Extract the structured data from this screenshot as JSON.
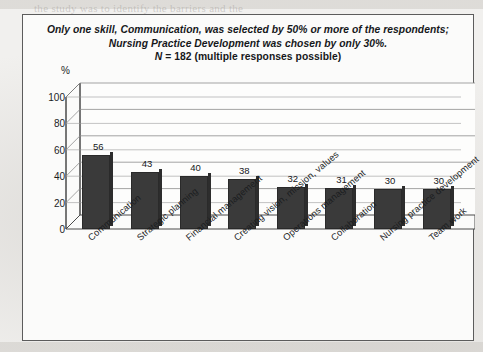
{
  "figure": {
    "title_lines": [
      "Only one skill, Communication, was selected by 50% or more of the respondents;",
      "Nursing Practice Development was chosen by only 30%."
    ],
    "sample_note_prefix": "N",
    "sample_note_rest": " = 182 (multiple responses possible)",
    "axis_unit_label": "%"
  },
  "background_marks": {
    "top_bleed": "the study was to identify the barriers and the",
    "mid_bleed_1": "were collected and analysed in",
    "mid_bleed_2": "respondents reported that",
    "bottom_bleed": "MA.Ed."
  },
  "chart_data": {
    "type": "bar",
    "title": "Only one skill, Communication, was selected by 50% or more of the respondents; Nursing Practice Development was chosen by only 30%.",
    "subtitle": "N = 182 (multiple responses possible)",
    "categories": [
      "Communication",
      "Strategic planning",
      "Financial management",
      "Creating vision, mission, values",
      "Operations management",
      "Collaboration",
      "Nursing practice development",
      "Team work"
    ],
    "values": [
      56,
      43,
      40,
      38,
      32,
      31,
      30,
      30
    ],
    "xlabel": "",
    "ylabel": "%",
    "ylim": [
      0,
      100
    ],
    "yticks": [
      0,
      20,
      40,
      60,
      80,
      100
    ],
    "grid": true,
    "legend": "none",
    "bar_color": "#3a3a3a",
    "n": 182
  }
}
